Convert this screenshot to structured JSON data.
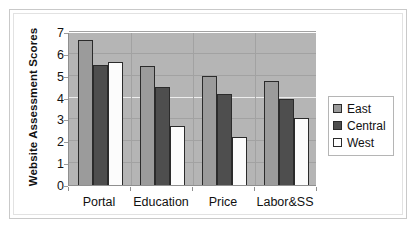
{
  "chart_data": {
    "type": "bar",
    "title": "",
    "xlabel": "",
    "ylabel": "Website Assessment Scores",
    "categories": [
      "Portal",
      "Education",
      "Price",
      "Labor&SS"
    ],
    "series": [
      {
        "name": "East",
        "color": "#9b9b9b",
        "values": [
          6.65,
          5.45,
          5.0,
          4.75
        ]
      },
      {
        "name": "Central",
        "color": "#4e4e4e",
        "values": [
          5.5,
          4.5,
          4.15,
          3.95
        ]
      },
      {
        "name": "West",
        "color": "#ffffff",
        "values": [
          5.65,
          2.7,
          2.2,
          3.05
        ]
      }
    ],
    "ylim": [
      0,
      7
    ],
    "yticks": [
      7,
      6,
      5,
      4,
      3,
      2,
      1,
      0
    ],
    "grid": true,
    "legend_position": "right",
    "plot_background": "#b5b5b5"
  },
  "legend": {
    "items": [
      {
        "label": "East"
      },
      {
        "label": "Central"
      },
      {
        "label": "West"
      }
    ]
  }
}
